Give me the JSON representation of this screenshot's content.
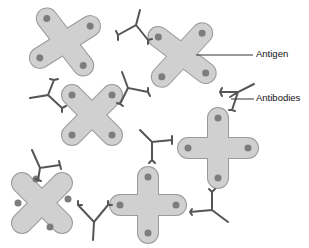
{
  "diagram": {
    "labels": {
      "antigen": "Antigen",
      "antibodies": "Antibodies"
    },
    "colors": {
      "antigen_fill": "#cfcfcf",
      "antigen_stroke": "#9a9a9a",
      "epitope_dot": "#7d7d7d",
      "antibody": "#555555",
      "label_line": "#333333"
    }
  }
}
